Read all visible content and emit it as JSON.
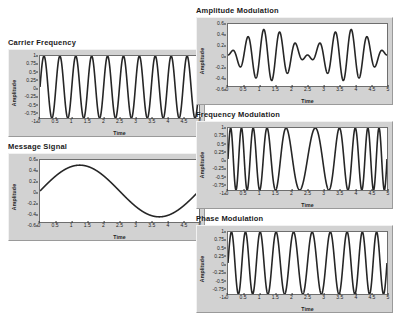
{
  "panels": [
    {
      "title": "Carrier Frequency",
      "xlabel": "Time",
      "ylabel": "Amplitude",
      "yticks": [
        "1",
        "0.75",
        "0.5",
        "0.25",
        "0",
        "-0.25",
        "-0.5",
        "-0.75",
        "-1"
      ],
      "xticks": [
        "0",
        "0.5",
        "1",
        "1.5",
        "2",
        "2.5",
        "3",
        "3.5",
        "4",
        "4.5",
        "5"
      ]
    },
    {
      "title": "Message Signal",
      "xlabel": "Time",
      "ylabel": "Amplitude",
      "yticks": [
        "0.6",
        "0.4",
        "0.2",
        "0",
        "-0.2",
        "-0.4",
        "-0.6"
      ],
      "xticks": [
        "0",
        "0.5",
        "1",
        "1.5",
        "2",
        "2.5",
        "3",
        "3.5",
        "4",
        "4.5",
        "5"
      ]
    },
    {
      "title": "Amplitude Modulation",
      "xlabel": "Time",
      "ylabel": "Amplitude",
      "yticks": [
        "0.6",
        "0.4",
        "0.2",
        "0",
        "-0.2",
        "-0.4",
        "-0.6"
      ],
      "xticks": [
        "0",
        "0.5",
        "1",
        "1.5",
        "2",
        "2.5",
        "3",
        "3.5",
        "4",
        "4.5",
        "5"
      ]
    },
    {
      "title": "Frequency Modulation",
      "xlabel": "Time",
      "ylabel": "Amplitude",
      "yticks": [
        "1",
        "0.75",
        "0.5",
        "0.25",
        "0",
        "-0.25",
        "-0.5",
        "-0.75",
        "-1"
      ],
      "xticks": [
        "0",
        "0.5",
        "1",
        "1.5",
        "2",
        "2.5",
        "3",
        "3.5",
        "4",
        "4.5",
        "5"
      ]
    },
    {
      "title": "Phase Modulation",
      "xlabel": "Time",
      "ylabel": "Amplitude",
      "yticks": [
        "1",
        "0.75",
        "0.5",
        "0.25",
        "0",
        "-0.25",
        "-0.5",
        "-0.75",
        "-1"
      ],
      "xticks": [
        "0",
        "0.5",
        "1",
        "1.5",
        "2",
        "2.5",
        "3",
        "3.5",
        "4",
        "4.5",
        "5"
      ]
    }
  ],
  "colors": {
    "trace": "#262626",
    "plot_background": "#ffffff",
    "panel_background": "#d2d2d2",
    "page_background": "#ffffff"
  },
  "chart_data": [
    {
      "type": "line",
      "title": "Carrier Frequency",
      "xlabel": "Time",
      "ylabel": "Amplitude",
      "xlim": [
        0,
        5
      ],
      "ylim": [
        -1,
        1
      ],
      "grid": false,
      "legend": "none",
      "series": [
        {
          "name": "carrier",
          "formula": "sin(2*pi*2*t)",
          "carrier_frequency_hz": 2,
          "amplitude": 1,
          "cycles_shown": 10
        }
      ]
    },
    {
      "type": "line",
      "title": "Message Signal",
      "xlabel": "Time",
      "ylabel": "Amplitude",
      "xlim": [
        0,
        5
      ],
      "ylim": [
        -0.6,
        0.6
      ],
      "grid": false,
      "legend": "none",
      "series": [
        {
          "name": "message",
          "formula": "0.5*sin(2*pi*0.2*t)",
          "message_frequency_hz": 0.2,
          "amplitude": 0.5,
          "x": [
            0,
            0.25,
            0.5,
            0.75,
            1,
            1.25,
            1.5,
            1.75,
            2,
            2.25,
            2.5,
            2.75,
            3,
            3.25,
            3.5,
            3.75,
            4,
            4.25,
            4.5,
            4.75,
            5
          ],
          "y": [
            0,
            0.154,
            0.294,
            0.405,
            0.476,
            0.5,
            0.476,
            0.405,
            0.294,
            0.154,
            0,
            -0.154,
            -0.294,
            -0.405,
            -0.476,
            -0.5,
            -0.476,
            -0.405,
            -0.294,
            -0.154,
            0
          ]
        }
      ]
    },
    {
      "type": "line",
      "title": "Amplitude Modulation",
      "xlabel": "Time",
      "ylabel": "Amplitude",
      "xlim": [
        0,
        5
      ],
      "ylim": [
        -0.6,
        0.6
      ],
      "grid": false,
      "legend": "none",
      "series": [
        {
          "name": "am",
          "formula": "0.5*sin(2*pi*0.2*t)*sin(2*pi*2*t)",
          "carrier_frequency_hz": 2,
          "message_frequency_hz": 0.2,
          "modulation_index": 1,
          "envelope_peak": 0.5
        }
      ]
    },
    {
      "type": "line",
      "title": "Frequency Modulation",
      "xlabel": "Time",
      "ylabel": "Amplitude",
      "xlim": [
        0,
        5
      ],
      "ylim": [
        -1,
        1
      ],
      "grid": false,
      "legend": "none",
      "series": [
        {
          "name": "fm",
          "formula": "sin(2*pi*2*t + 5*sin(2*pi*0.2*t))",
          "carrier_frequency_hz": 2,
          "message_frequency_hz": 0.2,
          "frequency_deviation": 5,
          "amplitude": 1
        }
      ]
    },
    {
      "type": "line",
      "title": "Phase Modulation",
      "xlabel": "Time",
      "ylabel": "Amplitude",
      "xlim": [
        0,
        5
      ],
      "ylim": [
        -1,
        1
      ],
      "grid": false,
      "legend": "none",
      "series": [
        {
          "name": "pm",
          "formula": "sin(2*pi*2*t + 1.5*sin(2*pi*0.2*t))",
          "carrier_frequency_hz": 2,
          "message_frequency_hz": 0.2,
          "phase_deviation": 1.5,
          "amplitude": 1
        }
      ]
    }
  ]
}
